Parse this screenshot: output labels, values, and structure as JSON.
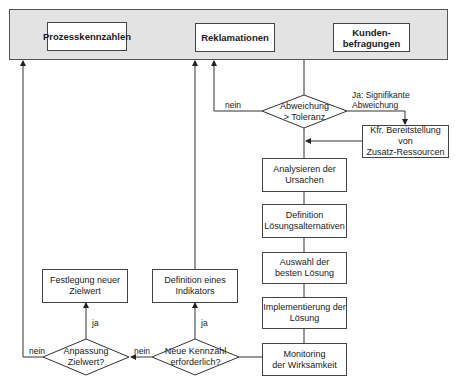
{
  "top_band": {
    "sources": [
      {
        "id": "prozesskennzahlen",
        "label": "Prozesskennzahlen"
      },
      {
        "id": "reklamationen",
        "label": "Reklamationen"
      },
      {
        "id": "kundenbefragungen",
        "label": "Kunden-\nbefragungen"
      }
    ]
  },
  "decisions": {
    "abweichung": "Abweichung\n> Toleranz",
    "neue_kennzahl": "Neue Kennzahl\nerforderlich?",
    "anpassung": "Anpassung\nZielwert?"
  },
  "process": {
    "bereitstellung": "Kfr. Bereitstellung von\nZusatz-Ressourcen",
    "analysieren": "Analysieren der\nUrsachen",
    "definition_loesung": "Definition\nLösungsalternativen",
    "auswahl": "Auswahl der\nbesten Lösung",
    "implementierung": "Implementierung der\nLösung",
    "monitoring": "Monitoring\nder Wirksamkeit",
    "definition_indikator": "Definition eines\nIndikators",
    "festlegung": "Festlegung neuer\nZielwert"
  },
  "edge_labels": {
    "ja_signifikant": "Ja: Signifikante\nAbweichung",
    "nein_abweichung": "nein",
    "nein_kennzahl": "nein",
    "nein_anpassung": "nein",
    "ja_kennzahl": "ja",
    "ja_anpassung": "ja"
  }
}
